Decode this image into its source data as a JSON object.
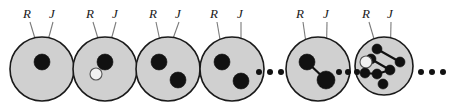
{
  "figure": {
    "name": "sequence-of-cells-with-R-and-J-particles",
    "background_color": "#ffffff",
    "cell_fill_color": "#d0d0d0",
    "cell_stroke_color": "#1a1a1a",
    "particle_color": "#111111",
    "hollow_particle_fill": "#f2f2f2",
    "leader_line_color": "#7a7a7a",
    "bond_color": "#111111",
    "label_R": "R",
    "label_J": "J",
    "ellipsis_char": "•",
    "cells": [
      {
        "index": 1,
        "cx": 42,
        "cy": 69,
        "r": 32,
        "labels": [
          {
            "text": "R",
            "x": 27,
            "y": 18
          },
          {
            "text": "J",
            "x": 52,
            "y": 18
          }
        ],
        "leaders": [
          {
            "x1": 30,
            "y1": 22,
            "x2": 40,
            "y2": 55
          },
          {
            "x1": 53,
            "y1": 22,
            "x2": 44,
            "y2": 55
          }
        ],
        "particles": [
          {
            "cx": 42,
            "cy": 62,
            "r": 8,
            "filled": true
          }
        ],
        "bonds": []
      },
      {
        "index": 2,
        "cx": 105,
        "cy": 69,
        "r": 32,
        "labels": [
          {
            "text": "R",
            "x": 90,
            "y": 18
          },
          {
            "text": "J",
            "x": 115,
            "y": 18
          }
        ],
        "leaders": [
          {
            "x1": 93,
            "y1": 22,
            "x2": 103,
            "y2": 55
          },
          {
            "x1": 116,
            "y1": 22,
            "x2": 107,
            "y2": 55
          }
        ],
        "particles": [
          {
            "cx": 105,
            "cy": 62,
            "r": 8,
            "filled": true
          },
          {
            "cx": 96,
            "cy": 74,
            "r": 6,
            "filled": false
          }
        ],
        "bonds": []
      },
      {
        "index": 3,
        "cx": 168,
        "cy": 69,
        "r": 32,
        "labels": [
          {
            "text": "R",
            "x": 153,
            "y": 18
          },
          {
            "text": "J",
            "x": 178,
            "y": 18
          }
        ],
        "leaders": [
          {
            "x1": 156,
            "y1": 22,
            "x2": 163,
            "y2": 55
          },
          {
            "x1": 179,
            "y1": 22,
            "x2": 167,
            "y2": 55
          }
        ],
        "particles": [
          {
            "cx": 159,
            "cy": 62,
            "r": 8,
            "filled": true
          },
          {
            "cx": 178,
            "cy": 80,
            "r": 8,
            "filled": true
          }
        ],
        "bonds": []
      },
      {
        "index": 4,
        "cx": 232,
        "cy": 69,
        "r": 32,
        "labels": [
          {
            "text": "R",
            "x": 214,
            "y": 18
          },
          {
            "text": "J",
            "x": 240,
            "y": 18
          }
        ],
        "leaders": [
          {
            "x1": 217,
            "y1": 22,
            "x2": 223,
            "y2": 57
          },
          {
            "x1": 241,
            "y1": 22,
            "x2": 241,
            "y2": 76
          }
        ],
        "particles": [
          {
            "cx": 222,
            "cy": 62,
            "r": 8,
            "filled": true
          },
          {
            "cx": 241,
            "cy": 81,
            "r": 8,
            "filled": true
          }
        ],
        "bonds": []
      },
      {
        "index": 5,
        "cx": 318,
        "cy": 69,
        "r": 32,
        "labels": [
          {
            "text": "R",
            "x": 300,
            "y": 18
          },
          {
            "text": "J",
            "x": 326,
            "y": 18
          }
        ],
        "leaders": [
          {
            "x1": 303,
            "y1": 22,
            "x2": 308,
            "y2": 57
          },
          {
            "x1": 327,
            "y1": 22,
            "x2": 326,
            "y2": 74
          }
        ],
        "particles": [
          {
            "cx": 307,
            "cy": 62,
            "r": 8,
            "filled": true
          },
          {
            "cx": 326,
            "cy": 80,
            "r": 9,
            "filled": true
          }
        ],
        "bonds": [
          {
            "x1": 307,
            "y1": 62,
            "x2": 326,
            "y2": 80
          }
        ]
      },
      {
        "index": 6,
        "cx": 384,
        "cy": 66,
        "r": 29,
        "labels": [
          {
            "text": "R",
            "x": 366,
            "y": 18
          },
          {
            "text": "J",
            "x": 390,
            "y": 18
          }
        ],
        "leaders": [
          {
            "x1": 369,
            "y1": 22,
            "x2": 377,
            "y2": 49
          },
          {
            "x1": 391,
            "y1": 22,
            "x2": 390,
            "y2": 70
          }
        ],
        "particles": [
          {
            "cx": 377,
            "cy": 49,
            "r": 5,
            "filled": true
          },
          {
            "cx": 371,
            "cy": 59,
            "r": 5,
            "filled": true
          },
          {
            "cx": 366,
            "cy": 62,
            "r": 6,
            "filled": false
          },
          {
            "cx": 400,
            "cy": 62,
            "r": 5,
            "filled": true
          },
          {
            "cx": 390,
            "cy": 70,
            "r": 5,
            "filled": true
          },
          {
            "cx": 365,
            "cy": 73,
            "r": 5,
            "filled": true
          },
          {
            "cx": 377,
            "cy": 74,
            "r": 5,
            "filled": true
          },
          {
            "cx": 383,
            "cy": 84,
            "r": 5,
            "filled": true
          }
        ],
        "bonds": [
          {
            "x1": 377,
            "y1": 49,
            "x2": 400,
            "y2": 62
          },
          {
            "x1": 371,
            "y1": 59,
            "x2": 390,
            "y2": 70
          },
          {
            "x1": 365,
            "y1": 73,
            "x2": 377,
            "y2": 74
          },
          {
            "x1": 377,
            "y1": 74,
            "x2": 390,
            "y2": 70
          }
        ]
      }
    ],
    "ellipses": [
      {
        "name": "ellipsis-left",
        "dots": [
          {
            "cx": 259,
            "cy": 72
          },
          {
            "cx": 270,
            "cy": 72
          },
          {
            "cx": 281,
            "cy": 72
          }
        ],
        "r": 3
      },
      {
        "name": "ellipsis-middle",
        "dots": [
          {
            "cx": 339,
            "cy": 72
          },
          {
            "cx": 348,
            "cy": 72
          },
          {
            "cx": 357,
            "cy": 72
          }
        ],
        "r": 3
      },
      {
        "name": "ellipsis-right",
        "dots": [
          {
            "cx": 421,
            "cy": 72
          },
          {
            "cx": 432,
            "cy": 72
          },
          {
            "cx": 443,
            "cy": 72
          }
        ],
        "r": 3
      }
    ]
  }
}
